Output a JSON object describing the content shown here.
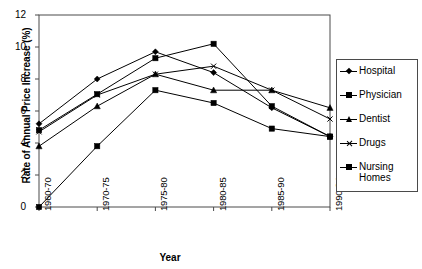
{
  "chart_data": {
    "type": "line",
    "title": "",
    "xlabel": "Year",
    "ylabel": "Rate of Annual Price Increase (%)",
    "categories": [
      "1960-70",
      "1970-75",
      "1975-80",
      "1980-85",
      "1985-90",
      "1990-94"
    ],
    "ylim": [
      0,
      12
    ],
    "y_ticks": [
      0,
      2,
      4,
      6,
      8,
      10,
      12
    ],
    "grid": false,
    "legend_position": "right",
    "series": [
      {
        "name": "Hospital",
        "marker": "diamond",
        "values": [
          5.2,
          8.0,
          9.7,
          8.4,
          6.2,
          4.4
        ]
      },
      {
        "name": "Physician",
        "marker": "square",
        "values": [
          4.8,
          7.05,
          9.3,
          10.2,
          6.3,
          4.4
        ]
      },
      {
        "name": "Dentist",
        "marker": "triangle",
        "values": [
          3.8,
          6.3,
          8.3,
          7.3,
          7.3,
          6.2
        ]
      },
      {
        "name": "Drugs",
        "marker": "x",
        "values": [
          4.7,
          7.0,
          8.3,
          8.8,
          7.3,
          5.5
        ]
      },
      {
        "name": "Nursing Homes",
        "marker": "square",
        "values": [
          0.0,
          3.8,
          7.3,
          6.5,
          4.9,
          4.4
        ]
      }
    ]
  },
  "axes": {
    "y_title": "Rate of Annual Price Increase (%)",
    "x_title": "Year",
    "y_tick_labels": [
      "12",
      "10",
      "8",
      "6",
      "4",
      "2",
      "0"
    ],
    "x_tick_labels": [
      "1960-70",
      "1970-75",
      "1975-80",
      "1980-85",
      "1985-90",
      "1990-94"
    ]
  },
  "legend": {
    "items": [
      {
        "label": "Hospital",
        "marker": "diamond-marker"
      },
      {
        "label": "Physician",
        "marker": "square-marker"
      },
      {
        "label": "Dentist",
        "marker": "triangle-marker"
      },
      {
        "label": "Drugs",
        "marker": "x-marker"
      },
      {
        "label": "Nursing\nHomes",
        "marker": "square-marker"
      }
    ]
  },
  "colors": {
    "line": "#000000",
    "axis": "#4a4a4a",
    "background": "#ffffff"
  }
}
